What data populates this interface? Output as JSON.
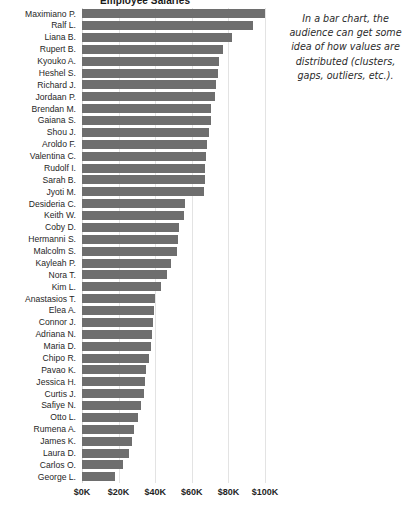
{
  "chart_data": {
    "type": "bar",
    "orientation": "horizontal",
    "title": "Employee Salaries",
    "xlabel": "",
    "ylabel": "",
    "xlim": [
      0,
      105
    ],
    "xticks": [
      0,
      20,
      40,
      60,
      80,
      100
    ],
    "xtick_labels": [
      "$0K",
      "$20K",
      "$40K",
      "$60K",
      "$80K",
      "$100K"
    ],
    "grid": true,
    "legend": null,
    "bar_color": "#6e6e6e",
    "units": "thousands of dollars",
    "categories": [
      "Maximiano P.",
      "Ralf L.",
      "Liana B.",
      "Rupert B.",
      "Kyouko A.",
      "Heshel S.",
      "Richard J.",
      "Jordaan P.",
      "Brendan M.",
      "Gaiana S.",
      "Shou J.",
      "Aroldo F.",
      "Valentina C.",
      "Rudolf I.",
      "Sarah B.",
      "Jyoti M.",
      "Desideria C.",
      "Keith W.",
      "Coby D.",
      "Hermanni S.",
      "Malcolm S.",
      "Kayleah P.",
      "Nora T.",
      "Kim L.",
      "Anastasios T.",
      "Elea A.",
      "Connor J.",
      "Adriana N.",
      "Maria D.",
      "Chipo R.",
      "Pavao K.",
      "Jessica H.",
      "Curtis J.",
      "Safiye N.",
      "Otto L.",
      "Rumena A.",
      "James K.",
      "Laura D.",
      "Carlos O.",
      "George L."
    ],
    "values": [
      100.2,
      93.4,
      82.1,
      77.1,
      74.9,
      74.3,
      73.4,
      72.8,
      70.6,
      70.6,
      69.2,
      68.5,
      67.9,
      67.4,
      67.0,
      66.7,
      56.1,
      55.7,
      53.0,
      52.5,
      52.1,
      48.8,
      46.6,
      43.4,
      40.1,
      39.4,
      39.0,
      38.5,
      37.6,
      36.4,
      35.1,
      34.4,
      33.8,
      32.0,
      30.6,
      28.4,
      27.2,
      25.6,
      22.4,
      18.2
    ],
    "annotation": "In a bar chart, the audience can get some idea of how values are distributed (clusters, gaps, outliers, etc.)."
  }
}
